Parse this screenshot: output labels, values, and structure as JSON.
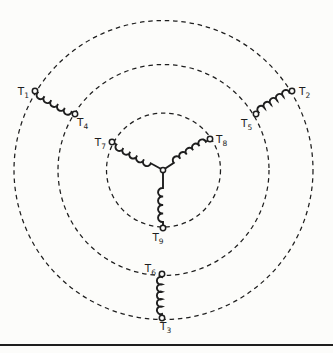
{
  "figure": {
    "kind": "nine-lead-wye-motor-winding-diagram",
    "canvas": {
      "width": 333,
      "height": 353
    },
    "colors": {
      "ink": "#1e1e1e",
      "paper": "#fcfcfa"
    },
    "guide_circles": {
      "cx": 163.5,
      "cy": 170,
      "dash": "4.5 3.8",
      "stroke_width": 1.25,
      "rings": [
        {
          "name": "outer",
          "r": 149.5
        },
        {
          "name": "middle",
          "r": 105.5
        },
        {
          "name": "inner",
          "r": 57
        }
      ]
    },
    "star_point": {
      "x": 163,
      "y": 170,
      "r": 2.6
    },
    "terminals": [
      {
        "id": "T1",
        "label": "T",
        "sub": "1",
        "x": 35,
        "y": 91,
        "lx": 29,
        "ly": 95,
        "anchor": "end"
      },
      {
        "id": "T2",
        "label": "T",
        "sub": "2",
        "x": 292,
        "y": 91,
        "lx": 299,
        "ly": 95,
        "anchor": "start"
      },
      {
        "id": "T3",
        "label": "T",
        "sub": "3",
        "x": 162,
        "y": 318,
        "lx": 160,
        "ly": 330,
        "anchor": "start"
      },
      {
        "id": "T4",
        "label": "T",
        "sub": "4",
        "x": 75,
        "y": 114,
        "lx": 77,
        "ly": 126,
        "anchor": "start"
      },
      {
        "id": "T5",
        "label": "T",
        "sub": "5",
        "x": 256,
        "y": 114,
        "lx": 241,
        "ly": 127,
        "anchor": "start"
      },
      {
        "id": "T6",
        "label": "T",
        "sub": "6",
        "x": 162,
        "y": 274,
        "lx": 156,
        "ly": 272,
        "anchor": "end"
      },
      {
        "id": "T7",
        "label": "T",
        "sub": "7",
        "x": 112,
        "y": 142,
        "lx": 106,
        "ly": 146,
        "anchor": "end"
      },
      {
        "id": "T8",
        "label": "T",
        "sub": "8",
        "x": 210,
        "y": 139,
        "lx": 216,
        "ly": 143,
        "anchor": "start"
      },
      {
        "id": "T9",
        "label": "T",
        "sub": "9",
        "x": 163,
        "y": 228,
        "lx": 158,
        "ly": 241,
        "anchor": "middle"
      }
    ],
    "windings": [
      {
        "name": "coil-T1-T4",
        "x1": 35,
        "y1": 91,
        "x2": 75,
        "y2": 114,
        "lead1": 3,
        "lead2": 4,
        "loops": 5,
        "loop_r": 4
      },
      {
        "name": "coil-T2-T5",
        "x1": 292,
        "y1": 91,
        "x2": 256,
        "y2": 114,
        "lead1": 3,
        "lead2": 3,
        "loops": 5,
        "loop_r": 3.8
      },
      {
        "name": "coil-T7-star",
        "x1": 112,
        "y1": 142,
        "x2": 163,
        "y2": 170,
        "lead1": 5,
        "lead2": 14,
        "loops": 5,
        "loop_r": 4
      },
      {
        "name": "coil-T8-star",
        "x1": 210,
        "y1": 139,
        "x2": 163,
        "y2": 170,
        "lead1": 5,
        "lead2": 13,
        "loops": 5,
        "loop_r": 3.9
      },
      {
        "name": "coil-star-T9",
        "x1": 163,
        "y1": 170,
        "x2": 163,
        "y2": 228,
        "lead1": 18,
        "lead2": 6,
        "loops": 4,
        "loop_r": 4.3
      },
      {
        "name": "coil-T6-T3",
        "x1": 162,
        "y1": 274,
        "x2": 162,
        "y2": 318,
        "lead1": 3,
        "lead2": 4,
        "loops": 5,
        "loop_r": 3.9
      }
    ],
    "label_style": {
      "font_size": 10.5,
      "sub_size": 7.5,
      "sub_dy": 2.6
    },
    "line_style": {
      "coil_width": 1.9,
      "terminal_r": 2.7,
      "terminal_stroke": 1.5
    },
    "bottom_rule": {
      "x1": 0,
      "x2": 333,
      "y": 345,
      "stroke_width": 2.2
    }
  }
}
